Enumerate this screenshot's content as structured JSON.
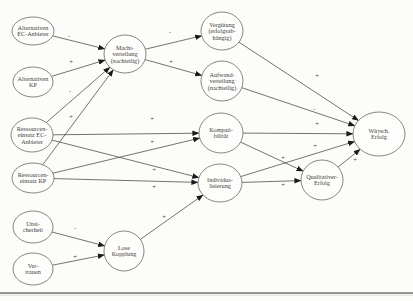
{
  "diagram": {
    "type": "path-model",
    "language": "de",
    "background_color": "#fcfcfa",
    "node_fill_color": "#fdfdfb",
    "node_stroke_color": "#6a6761",
    "edge_color": "#52504a",
    "arrow_color": "#1a1a18",
    "text_color": "#45423c",
    "footer_rule_color": "#95958f",
    "footer_rule_light_color": "#d8d8d4",
    "nodes": [
      {
        "id": "alternativen-ec-anbieter",
        "lines": [
          "Alternativen",
          "EC-Anbieter"
        ],
        "cx": 33,
        "cy": 31,
        "rx": 21,
        "ry": 14
      },
      {
        "id": "alternativen-kp",
        "lines": [
          "Alternativen",
          "KP"
        ],
        "cx": 33,
        "cy": 82,
        "rx": 20,
        "ry": 15
      },
      {
        "id": "ressourceneinsatz-ec-anbieter",
        "lines": [
          "Ressourcen-",
          "einsatz EC-",
          "Anbieter"
        ],
        "cx": 32,
        "cy": 135,
        "rx": 21,
        "ry": 17
      },
      {
        "id": "ressourceneinsatz-kp",
        "lines": [
          "Ressourcen-",
          "einsatz KP"
        ],
        "cx": 33,
        "cy": 178,
        "rx": 21,
        "ry": 15
      },
      {
        "id": "unsicherheit",
        "lines": [
          "Unsi-",
          "cherheit"
        ],
        "cx": 33,
        "cy": 227,
        "rx": 20,
        "ry": 16
      },
      {
        "id": "vertrauen",
        "lines": [
          "Ver-",
          "trauen"
        ],
        "cx": 33,
        "cy": 269,
        "rx": 20,
        "ry": 16
      },
      {
        "id": "machtverteilung",
        "lines": [
          "Macht-",
          "verteilung",
          "(nachteilig)"
        ],
        "cx": 125,
        "cy": 54,
        "rx": 21,
        "ry": 19
      },
      {
        "id": "lose-kopplung",
        "lines": [
          "Lose",
          "Kopplung"
        ],
        "cx": 124,
        "cy": 251,
        "rx": 20,
        "ry": 20
      },
      {
        "id": "verguetung",
        "lines": [
          "Vergütung",
          "(erfolgsab-",
          "hängig)"
        ],
        "cx": 222,
        "cy": 31,
        "rx": 21,
        "ry": 19
      },
      {
        "id": "aufwandverteilung",
        "lines": [
          "Aufwand-",
          "verteilung",
          "(nachteilig)"
        ],
        "cx": 222,
        "cy": 81,
        "rx": 21,
        "ry": 20
      },
      {
        "id": "kompatibilitaet",
        "lines": [
          "Kompati-",
          "bilität"
        ],
        "cx": 221,
        "cy": 133,
        "rx": 22,
        "ry": 20
      },
      {
        "id": "individualisierung",
        "lines": [
          "Individua-",
          "lisierung"
        ],
        "cx": 220,
        "cy": 183,
        "rx": 22,
        "ry": 19
      },
      {
        "id": "qualitativer-erfolg",
        "lines": [
          "Qualitativer-",
          "Erfolg"
        ],
        "cx": 322,
        "cy": 180,
        "rx": 21,
        "ry": 20
      },
      {
        "id": "wirtsch-erfolg",
        "lines": [
          "Wirtsch.",
          "Erfolg"
        ],
        "cx": 379,
        "cy": 134,
        "rx": 26,
        "ry": 22
      }
    ],
    "edges": [
      {
        "from": "alternativen-ec-anbieter",
        "to": "machtverteilung",
        "sign": "-",
        "sign_x": 69,
        "sign_y": 36
      },
      {
        "from": "alternativen-kp",
        "to": "machtverteilung",
        "sign": "+",
        "sign_x": 71,
        "sign_y": 62
      },
      {
        "from": "ressourceneinsatz-ec-anbieter",
        "to": "machtverteilung",
        "sign": "-",
        "sign_x": 70,
        "sign_y": 91
      },
      {
        "from": "ressourceneinsatz-kp",
        "to": "machtverteilung",
        "sign": "+",
        "sign_x": 71,
        "sign_y": 117
      },
      {
        "from": "machtverteilung",
        "to": "verguetung",
        "sign": "-",
        "sign_x": 170,
        "sign_y": 32
      },
      {
        "from": "machtverteilung",
        "to": "aufwandverteilung",
        "sign": "+",
        "sign_x": 171,
        "sign_y": 62
      },
      {
        "from": "ressourceneinsatz-ec-anbieter",
        "to": "kompatibilitaet",
        "sign": "+",
        "sign_x": 152,
        "sign_y": 119
      },
      {
        "from": "ressourceneinsatz-kp",
        "to": "kompatibilitaet",
        "sign": "+",
        "sign_x": 152,
        "sign_y": 142
      },
      {
        "from": "ressourceneinsatz-ec-anbieter",
        "to": "individualisierung",
        "sign": "+",
        "sign_x": 154,
        "sign_y": 170
      },
      {
        "from": "ressourceneinsatz-kp",
        "to": "individualisierung",
        "sign": "+",
        "sign_x": 154,
        "sign_y": 187
      },
      {
        "from": "verguetung",
        "to": "wirtsch-erfolg",
        "sign": "+",
        "sign_x": 317,
        "sign_y": 76
      },
      {
        "from": "aufwandverteilung",
        "to": "wirtsch-erfolg",
        "sign": "-",
        "sign_x": 314,
        "sign_y": 109
      },
      {
        "from": "kompatibilitaet",
        "to": "wirtsch-erfolg",
        "sign": "+",
        "sign_x": 317,
        "sign_y": 124
      },
      {
        "from": "individualisierung",
        "to": "wirtsch-erfolg",
        "sign": "+",
        "sign_x": 315,
        "sign_y": 146
      },
      {
        "from": "kompatibilitaet",
        "to": "qualitativer-erfolg",
        "sign": "+",
        "sign_x": 283,
        "sign_y": 158
      },
      {
        "from": "individualisierung",
        "to": "qualitativer-erfolg",
        "sign": "+",
        "sign_x": 283,
        "sign_y": 185
      },
      {
        "from": "qualitativer-erfolg",
        "to": "wirtsch-erfolg",
        "sign": "+",
        "sign_x": 355,
        "sign_y": 160
      },
      {
        "from": "unsicherheit",
        "to": "lose-kopplung",
        "sign": "-",
        "sign_x": 75,
        "sign_y": 228
      },
      {
        "from": "vertrauen",
        "to": "lose-kopplung",
        "sign": "+",
        "sign_x": 75,
        "sign_y": 257
      },
      {
        "from": "lose-kopplung",
        "to": "individualisierung",
        "sign": "+",
        "sign_x": 164,
        "sign_y": 217
      }
    ],
    "footer_rule": {
      "y": 293,
      "x1": 0,
      "x2": 413
    }
  }
}
